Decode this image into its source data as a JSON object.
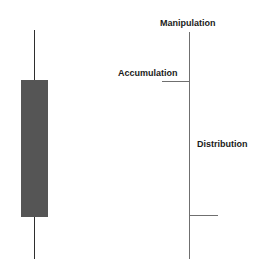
{
  "diagram": {
    "candle": {
      "body_color": "#555555",
      "wick_color": "#2e2e2e"
    },
    "ohlc_bar": {
      "line_color": "#6f6f6f",
      "labels": {
        "top": "Manipulation",
        "open": "Accumulation",
        "middle": "Distribution"
      }
    }
  }
}
